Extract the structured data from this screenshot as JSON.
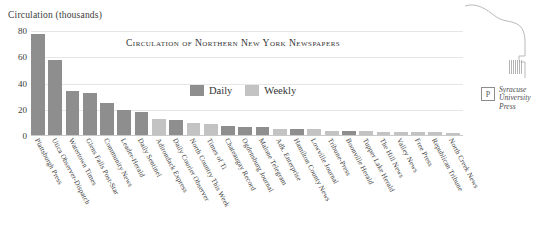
{
  "axis": {
    "y_title": "Circulation (thousands)",
    "yticks": [
      0,
      20,
      40,
      60,
      80
    ]
  },
  "chart_title": "Circulation of Northern New York Newspapers",
  "legend": {
    "position": "inside-top-center",
    "entries": [
      {
        "label": "Daily",
        "color": "#8e8e8e",
        "key": "daily"
      },
      {
        "label": "Weekly",
        "color": "#c3c3c3",
        "key": "weekly"
      }
    ]
  },
  "publisher": {
    "mark": "P",
    "line1": "Syracuse",
    "line2": "University",
    "line3": "Press"
  },
  "chart_data": {
    "type": "bar",
    "title": "Circulation of Northern New York Newspapers",
    "xlabel": "",
    "ylabel": "Circulation (thousands)",
    "ylim": [
      0,
      80
    ],
    "yticks": [
      0,
      20,
      40,
      60,
      80
    ],
    "grid": true,
    "legend": [
      "Daily",
      "Weekly"
    ],
    "colors": {
      "Daily": "#8e8e8e",
      "Weekly": "#c3c3c3"
    },
    "categories": [
      "Plattsburgh Press",
      "Utica Observer-Dispatch",
      "Watertown Times",
      "Glens Falls Post-Star",
      "Community News",
      "Leader-Herald",
      "Daily Sentinel",
      "Adirondack Express",
      "Daily Courier Observer",
      "North Country This Week",
      "Times of Ti",
      "Chateaugay Record",
      "Ogdensburg Journal",
      "Malone Telegram",
      "Adk. Enterprise",
      "Hamilton County News",
      "Lowville Journal",
      "Tribune-Press",
      "Boonville Herald",
      "Tupper Lake Herald",
      "The Hill News",
      "Valley News",
      "Free Press",
      "Republican Tribune",
      "North Creek News"
    ],
    "values": [
      78,
      58,
      34,
      33,
      25,
      20,
      18,
      13,
      12,
      10,
      9,
      8,
      7,
      7,
      5,
      5,
      5,
      4,
      4,
      4,
      3,
      3,
      3,
      3,
      2
    ],
    "types": [
      "daily",
      "daily",
      "daily",
      "daily",
      "daily",
      "daily",
      "daily",
      "weekly",
      "daily",
      "weekly",
      "weekly",
      "daily",
      "daily",
      "daily",
      "weekly",
      "daily",
      "weekly",
      "weekly",
      "daily",
      "weekly",
      "weekly",
      "weekly",
      "weekly",
      "weekly",
      "weekly"
    ]
  }
}
